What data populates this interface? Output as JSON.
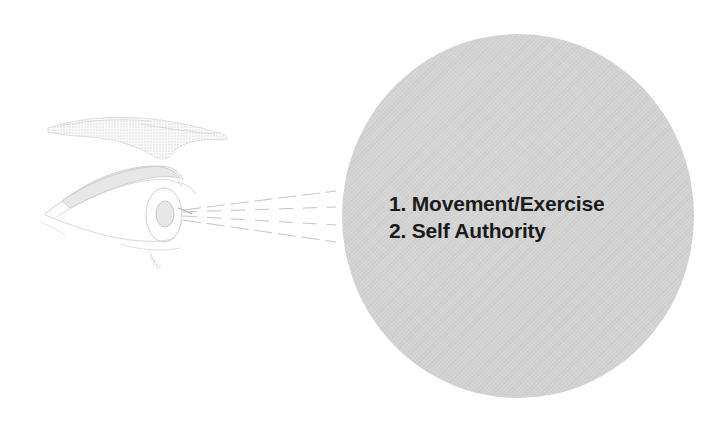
{
  "diagram": {
    "type": "eye-focus-illustration",
    "colors": {
      "circle_fill": "#d3d3d3",
      "text": "#1a1a1a",
      "illustration_stroke": "#c8c8c8",
      "sight_lines": "#bdbdbd"
    },
    "focus_items": [
      {
        "label": "1. Movement/Exercise"
      },
      {
        "label": "2. Self Authority"
      }
    ]
  }
}
